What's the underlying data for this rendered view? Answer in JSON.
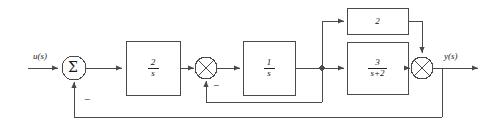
{
  "diagram": {
    "stroke_color": "#4a4a4a",
    "text_color": "#1a1a1a",
    "background": "#ffffff",
    "input_label": "u(s)",
    "output_label": "y(s)",
    "summing_junctions": [
      {
        "name": "sigma-junction",
        "glyph": "Σ",
        "sign": "−"
      },
      {
        "name": "inner-loop-junction",
        "glyph": "x-cross",
        "sign": "−"
      },
      {
        "name": "output-junction",
        "glyph": "x-cross",
        "sign": ""
      }
    ],
    "blocks": [
      {
        "name": "gain-block-2-over-s",
        "numerator": "2",
        "denominator": "s",
        "kind": "fraction"
      },
      {
        "name": "integrator-block-1-over-s",
        "numerator": "1",
        "denominator": "s",
        "kind": "fraction"
      },
      {
        "name": "feedforward-gain-block-2",
        "value": "2",
        "kind": "plain"
      },
      {
        "name": "lag-block-3-over-s-plus-2",
        "numerator": "3",
        "denominator": "s+2",
        "kind": "fraction"
      }
    ],
    "signs": {
      "outer_feedback": "−",
      "inner_feedback": "−"
    }
  }
}
